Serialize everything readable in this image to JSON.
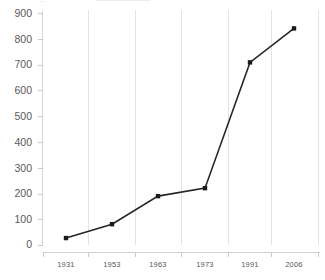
{
  "chart_data": {
    "type": "line",
    "title": "",
    "subtitle": "",
    "xlabel": "",
    "ylabel": "",
    "categories": [
      "1931",
      "1953",
      "1963",
      "1973",
      "1991",
      "2006"
    ],
    "x": [
      1931,
      1953,
      1963,
      1973,
      1991,
      2006
    ],
    "values": [
      27,
      81,
      190,
      221,
      710,
      842
    ],
    "series": [
      {
        "name": "series-1",
        "values": [
          27,
          81,
          190,
          221,
          710,
          842
        ],
        "color": "#262626",
        "marker": "square"
      }
    ],
    "ylim": [
      0,
      900
    ],
    "ytick_labels": [
      "0",
      "100",
      "200",
      "300",
      "400",
      "500",
      "600",
      "700",
      "800",
      "900"
    ],
    "ytick_values": [
      0,
      100,
      200,
      300,
      400,
      500,
      600,
      700,
      800,
      900
    ],
    "xtick_labels": [
      "1931",
      "1953",
      "1963",
      "1973",
      "1991",
      "2006"
    ],
    "grid": {
      "vertical": true,
      "horizontal": false,
      "color": "#e3e3e3"
    },
    "legend": {
      "visible": false,
      "position": "none",
      "entries": []
    },
    "colors": {
      "background": "#ffffff",
      "line": "#262626",
      "marker": "#1a1a1a",
      "grid": "#e3e3e3",
      "axis": "#d2d2d2",
      "tick_text": "#595959"
    },
    "annotations": []
  }
}
